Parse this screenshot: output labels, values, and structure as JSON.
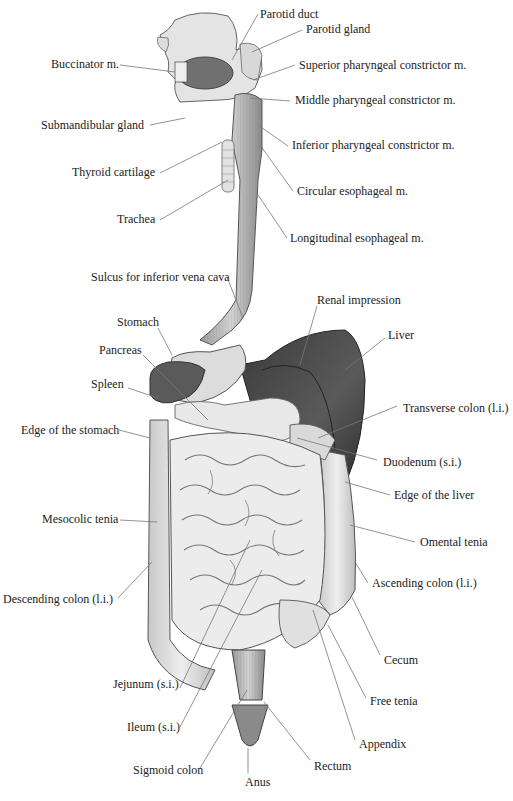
{
  "diagram": {
    "labels": [
      {
        "id": "parotid-duct",
        "text": "Parotid duct",
        "x": 260,
        "y": 7,
        "side": "right",
        "line": [
          [
            258,
            14
          ],
          [
            232,
            60
          ]
        ]
      },
      {
        "id": "parotid-gland",
        "text": "Parotid gland",
        "x": 306,
        "y": 22,
        "side": "right",
        "line": [
          [
            302,
            30
          ],
          [
            252,
            52
          ]
        ]
      },
      {
        "id": "buccinator",
        "text": "Buccinator m.",
        "x": 51,
        "y": 57,
        "side": "left",
        "line": [
          [
            120,
            65
          ],
          [
            175,
            72
          ]
        ]
      },
      {
        "id": "superior-pharyngeal",
        "text": "Superior pharyngeal constrictor m.",
        "x": 299,
        "y": 58,
        "side": "right",
        "line": [
          [
            295,
            65
          ],
          [
            253,
            80
          ]
        ]
      },
      {
        "id": "middle-pharyngeal",
        "text": "Middle pharyngeal constrictor m.",
        "x": 295,
        "y": 93,
        "side": "right",
        "line": [
          [
            290,
            101
          ],
          [
            250,
            98
          ]
        ]
      },
      {
        "id": "submandibular",
        "text": "Submandibular gland",
        "x": 41,
        "y": 118,
        "side": "left",
        "line": [
          [
            150,
            125
          ],
          [
            185,
            118
          ]
        ]
      },
      {
        "id": "inferior-pharyngeal",
        "text": "Inferior pharyngeal constrictor m.",
        "x": 292,
        "y": 138,
        "side": "right",
        "line": [
          [
            288,
            146
          ],
          [
            258,
            125
          ]
        ]
      },
      {
        "id": "thyroid",
        "text": "Thyroid cartilage",
        "x": 72,
        "y": 165,
        "side": "left",
        "line": [
          [
            160,
            173
          ],
          [
            222,
            142
          ]
        ]
      },
      {
        "id": "circular-esophageal",
        "text": "Circular esophageal m.",
        "x": 297,
        "y": 184,
        "side": "right",
        "line": [
          [
            293,
            191
          ],
          [
            260,
            145
          ]
        ]
      },
      {
        "id": "trachea",
        "text": "Trachea",
        "x": 117,
        "y": 212,
        "side": "left",
        "line": [
          [
            160,
            220
          ],
          [
            228,
            180
          ]
        ]
      },
      {
        "id": "longitudinal-esophageal",
        "text": "Longitudinal esophageal m.",
        "x": 290,
        "y": 231,
        "side": "right",
        "line": [
          [
            287,
            238
          ],
          [
            258,
            195
          ]
        ]
      },
      {
        "id": "sulcus-ivc",
        "text": "Sulcus for inferior vena cava",
        "x": 91,
        "y": 270,
        "side": "left",
        "line": [
          [
            227,
            277
          ],
          [
            243,
            318
          ]
        ]
      },
      {
        "id": "renal-impression",
        "text": "Renal impression",
        "x": 317,
        "y": 293,
        "side": "right",
        "line": [
          [
            317,
            306
          ],
          [
            300,
            365
          ]
        ]
      },
      {
        "id": "stomach",
        "text": "Stomach",
        "x": 117,
        "y": 315,
        "side": "left",
        "line": [
          [
            158,
            328
          ],
          [
            172,
            355
          ]
        ]
      },
      {
        "id": "liver",
        "text": "Liver",
        "x": 388,
        "y": 328,
        "side": "right",
        "line": [
          [
            385,
            338
          ],
          [
            345,
            370
          ]
        ]
      },
      {
        "id": "pancreas",
        "text": "Pancreas",
        "x": 99,
        "y": 343,
        "side": "left",
        "line": [
          [
            143,
            355
          ],
          [
            208,
            420
          ]
        ]
      },
      {
        "id": "spleen",
        "text": "Spleen",
        "x": 91,
        "y": 377,
        "side": "left",
        "line": [
          [
            128,
            388
          ],
          [
            158,
            398
          ]
        ]
      },
      {
        "id": "transverse-colon",
        "text": "Transverse colon (l.i.)",
        "x": 403,
        "y": 401,
        "side": "right",
        "line": [
          [
            397,
            406
          ],
          [
            318,
            438
          ]
        ]
      },
      {
        "id": "edge-stomach",
        "text": "Edge of the stomach",
        "x": 21,
        "y": 423,
        "side": "left",
        "line": [
          [
            119,
            430
          ],
          [
            150,
            438
          ]
        ]
      },
      {
        "id": "duodenum",
        "text": "Duodenum (s.i.)",
        "x": 383,
        "y": 455,
        "side": "right",
        "line": [
          [
            377,
            460
          ],
          [
            297,
            438
          ]
        ]
      },
      {
        "id": "edge-liver",
        "text": "Edge of the liver",
        "x": 394,
        "y": 488,
        "side": "right",
        "line": [
          [
            390,
            495
          ],
          [
            345,
            482
          ]
        ]
      },
      {
        "id": "mesocolic",
        "text": "Mesocolic tenia",
        "x": 42,
        "y": 512,
        "side": "left",
        "line": [
          [
            120,
            520
          ],
          [
            157,
            522
          ]
        ]
      },
      {
        "id": "omental",
        "text": "Omental tenia",
        "x": 420,
        "y": 535,
        "side": "right",
        "line": [
          [
            415,
            542
          ],
          [
            350,
            525
          ]
        ]
      },
      {
        "id": "descending-colon",
        "text": "Descending colon (l.i.)",
        "x": 3,
        "y": 592,
        "side": "left",
        "line": [
          [
            118,
            598
          ],
          [
            152,
            562
          ]
        ]
      },
      {
        "id": "ascending-colon",
        "text": "Ascending colon (l.i.)",
        "x": 372,
        "y": 576,
        "side": "right",
        "line": [
          [
            368,
            583
          ],
          [
            355,
            562
          ]
        ]
      },
      {
        "id": "cecum",
        "text": "Cecum",
        "x": 384,
        "y": 653,
        "side": "right",
        "line": [
          [
            380,
            655
          ],
          [
            352,
            597
          ]
        ]
      },
      {
        "id": "jejunum",
        "text": "Jejunum (s.i.)",
        "x": 113,
        "y": 677,
        "side": "left",
        "line": [
          [
            180,
            688
          ],
          [
            250,
            540
          ]
        ]
      },
      {
        "id": "free-tenia",
        "text": "Free tenia",
        "x": 370,
        "y": 694,
        "side": "right",
        "line": [
          [
            366,
            698
          ],
          [
            328,
            625
          ]
        ]
      },
      {
        "id": "ileum",
        "text": "Ileum (s.i.)",
        "x": 127,
        "y": 720,
        "side": "left",
        "line": [
          [
            180,
            727
          ],
          [
            262,
            570
          ]
        ]
      },
      {
        "id": "appendix",
        "text": "Appendix",
        "x": 359,
        "y": 737,
        "side": "right",
        "line": [
          [
            355,
            740
          ],
          [
            313,
            610
          ]
        ]
      },
      {
        "id": "sigmoid-colon",
        "text": "Sigmoid colon",
        "x": 133,
        "y": 763,
        "side": "left",
        "line": [
          [
            200,
            768
          ],
          [
            247,
            690
          ]
        ]
      },
      {
        "id": "rectum",
        "text": "Rectum",
        "x": 314,
        "y": 759,
        "side": "right",
        "line": [
          [
            310,
            760
          ],
          [
            264,
            702
          ]
        ]
      },
      {
        "id": "anus",
        "text": "Anus",
        "x": 245,
        "y": 775,
        "side": "center",
        "line": [
          [
            248,
            773
          ],
          [
            248,
            748
          ]
        ]
      }
    ]
  }
}
